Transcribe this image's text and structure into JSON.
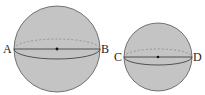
{
  "diagram": {
    "type": "two spheres with great-circle sections",
    "spheres": [
      {
        "name": "large-sphere",
        "cx": 57,
        "cy": 49,
        "r": 43,
        "labels": {
          "left": "A",
          "right": "B"
        }
      },
      {
        "name": "small-sphere",
        "cx": 158,
        "cy": 57,
        "r": 34,
        "labels": {
          "left": "C",
          "right": "D"
        }
      }
    ],
    "colors": {
      "fill": "#c4c4c4",
      "stroke": "#444444",
      "dash": "#9a9a9a"
    }
  }
}
